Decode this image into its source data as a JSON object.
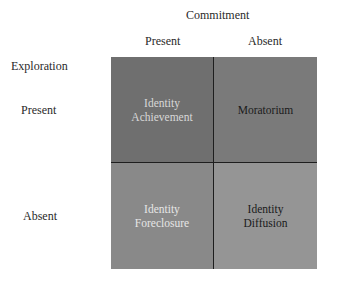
{
  "diagram": {
    "column_axis": {
      "title": "Commitment",
      "labels": [
        "Present",
        "Absent"
      ]
    },
    "row_axis": {
      "title": "Exploration",
      "labels": [
        "Present",
        "Absent"
      ]
    },
    "cells": [
      {
        "row": "Present",
        "col": "Present",
        "line1": "Identity",
        "line2": "Achievement",
        "color": "#6f6f6f"
      },
      {
        "row": "Present",
        "col": "Absent",
        "line1": "Moratorium",
        "line2": "",
        "color": "#7a7a7a"
      },
      {
        "row": "Absent",
        "col": "Present",
        "line1": "Identity",
        "line2": "Foreclosure",
        "color": "#898989"
      },
      {
        "row": "Absent",
        "col": "Absent",
        "line1": "Identity",
        "line2": "Diffusion",
        "color": "#959595"
      }
    ]
  }
}
